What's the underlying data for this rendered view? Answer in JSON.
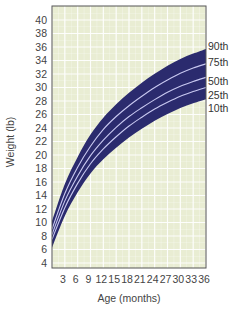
{
  "chart_data": {
    "type": "area",
    "title": "",
    "xlabel": "Age (months)",
    "ylabel": "Weight (lb)",
    "xlim": [
      0,
      36
    ],
    "ylim": [
      4,
      40
    ],
    "x_ticks": [
      3,
      6,
      9,
      12,
      15,
      18,
      21,
      24,
      27,
      30,
      33,
      36
    ],
    "y_ticks": [
      4,
      6,
      8,
      10,
      12,
      14,
      16,
      18,
      20,
      22,
      24,
      26,
      28,
      30,
      32,
      34,
      36,
      38,
      40
    ],
    "grid": true,
    "legend_position": "right (inline labels at curve ends)",
    "x": [
      0,
      3,
      6,
      9,
      12,
      15,
      18,
      21,
      24,
      27,
      30,
      33,
      36
    ],
    "series": [
      {
        "name": "90th",
        "values": [
          10.0,
          15.5,
          19.5,
          22.8,
          25.3,
          27.3,
          29.0,
          30.5,
          31.8,
          33.0,
          34.0,
          34.8,
          35.5
        ]
      },
      {
        "name": "75th",
        "values": [
          9.0,
          14.3,
          18.2,
          21.3,
          23.8,
          25.7,
          27.3,
          28.7,
          30.0,
          31.1,
          32.1,
          32.9,
          33.5
        ]
      },
      {
        "name": "50th",
        "values": [
          8.2,
          13.2,
          16.9,
          19.9,
          22.2,
          24.1,
          25.7,
          27.0,
          28.2,
          29.3,
          30.2,
          30.9,
          31.5
        ]
      },
      {
        "name": "25th",
        "values": [
          7.5,
          12.2,
          15.8,
          18.7,
          20.9,
          22.7,
          24.3,
          25.6,
          26.8,
          27.8,
          28.7,
          29.4,
          30.0
        ]
      },
      {
        "name": "10th",
        "values": [
          6.5,
          11.2,
          14.7,
          17.5,
          19.6,
          21.3,
          22.8,
          24.1,
          25.3,
          26.3,
          27.2,
          27.9,
          28.5
        ]
      }
    ],
    "band_color": "#2b2b6e",
    "curve_color": "#c8c8f0",
    "grid_background": "#e9edd3",
    "grid_line_color": "#ffffff"
  },
  "labels": {
    "xlabel": "Age (months)",
    "ylabel": "Weight (lb)",
    "percentiles": [
      "90th",
      "75th",
      "50th",
      "25th",
      "10th"
    ]
  }
}
